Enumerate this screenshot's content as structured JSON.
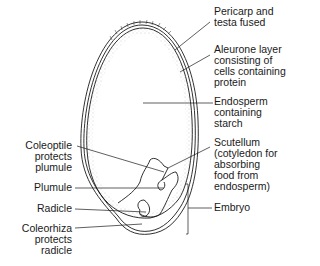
{
  "labels": {
    "pericarp": "Pericarp and\ntesta fused",
    "aleurone": "Aleurone layer\nconsisting of\ncells containing\nprotein",
    "endosperm": "Endosperm\ncontaining\nstarch",
    "scutellum": "Scutellum\n(cotyledon for\nabsorbing\nfood from\nendosperm)",
    "embryo": "Embryo",
    "coleoptile": "Coleoptile\nprotects\nplumule",
    "plumule": "Plumule",
    "radicle": "Radicle",
    "coleorhiza": "Coleorhiza\nprotects\nradicle"
  },
  "colors": {
    "line": "#1a1a1a",
    "stipple": "#888888",
    "background": "#ffffff"
  }
}
